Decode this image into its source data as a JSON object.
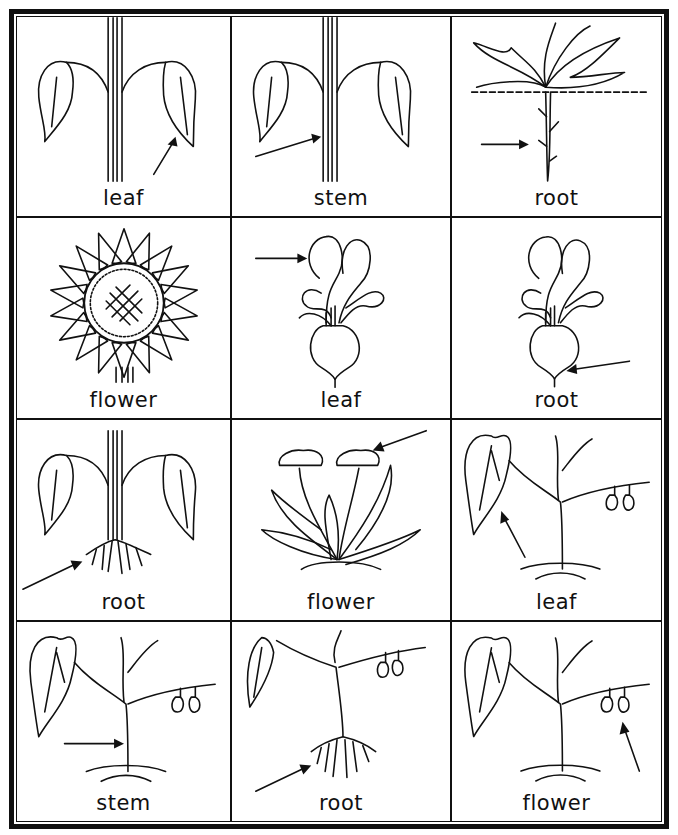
{
  "worksheet": {
    "rows": 4,
    "columns": 3,
    "cards": [
      {
        "label": "leaf",
        "plant": "stem-with-leaves",
        "arrow_target": "leaf"
      },
      {
        "label": "stem",
        "plant": "stem-with-leaves",
        "arrow_target": "stem"
      },
      {
        "label": "root",
        "plant": "dandelion-root",
        "arrow_target": "root"
      },
      {
        "label": "flower",
        "plant": "sunflower",
        "arrow_target": "flower"
      },
      {
        "label": "leaf",
        "plant": "beet",
        "arrow_target": "leaf"
      },
      {
        "label": "root",
        "plant": "beet",
        "arrow_target": "root"
      },
      {
        "label": "root",
        "plant": "stem-with-leaves",
        "arrow_target": "root"
      },
      {
        "label": "flower",
        "plant": "dandelion",
        "arrow_target": "flower"
      },
      {
        "label": "leaf",
        "plant": "bean-plant",
        "arrow_target": "leaf"
      },
      {
        "label": "stem",
        "plant": "bean-plant",
        "arrow_target": "stem"
      },
      {
        "label": "root",
        "plant": "bean-plant",
        "arrow_target": "root"
      },
      {
        "label": "flower",
        "plant": "bean-plant",
        "arrow_target": "flower"
      }
    ]
  }
}
